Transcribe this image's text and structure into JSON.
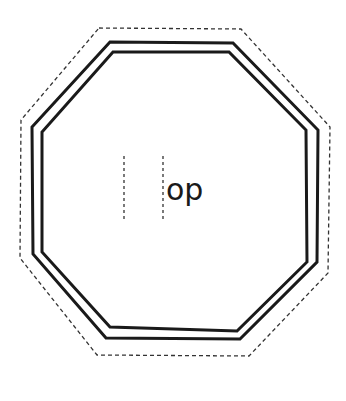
{
  "diagram": {
    "shape": "octagon",
    "label_text": "op",
    "colors": {
      "background": "#ffffff",
      "stroke": "#1a1a1a",
      "dashed_stroke": "#333333"
    },
    "guide_lines": [
      {
        "x": 124,
        "y1": 156,
        "y2": 220
      },
      {
        "x": 163,
        "y1": 156,
        "y2": 220
      }
    ],
    "outlines": {
      "dashed_outer": "99,28 241,29 330,127 328,273 249,356 97,355 20,258 21,120",
      "solid_outer": "110,42 233,43 318,130 317,262 240,339 106,338 33,254 32,127",
      "solid_inner": "113,52 229,52 306,130 307,262 237,331 110,327 42,252 42,132"
    }
  }
}
